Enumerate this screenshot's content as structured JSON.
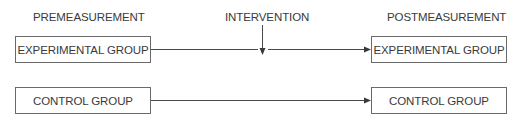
{
  "headers": {
    "pre": "PREMEASUREMENT",
    "intervention": "INTERVENTION",
    "post": "POSTMEASUREMENT"
  },
  "rows": [
    {
      "pre_label": "EXPERIMENTAL GROUP",
      "post_label": "EXPERIMENTAL GROUP",
      "receives_intervention": true
    },
    {
      "pre_label": "CONTROL GROUP",
      "post_label": "CONTROL GROUP",
      "receives_intervention": false
    }
  ],
  "colors": {
    "stroke": "#4a4a4a",
    "text": "#3a3a3a",
    "background": "#ffffff"
  }
}
